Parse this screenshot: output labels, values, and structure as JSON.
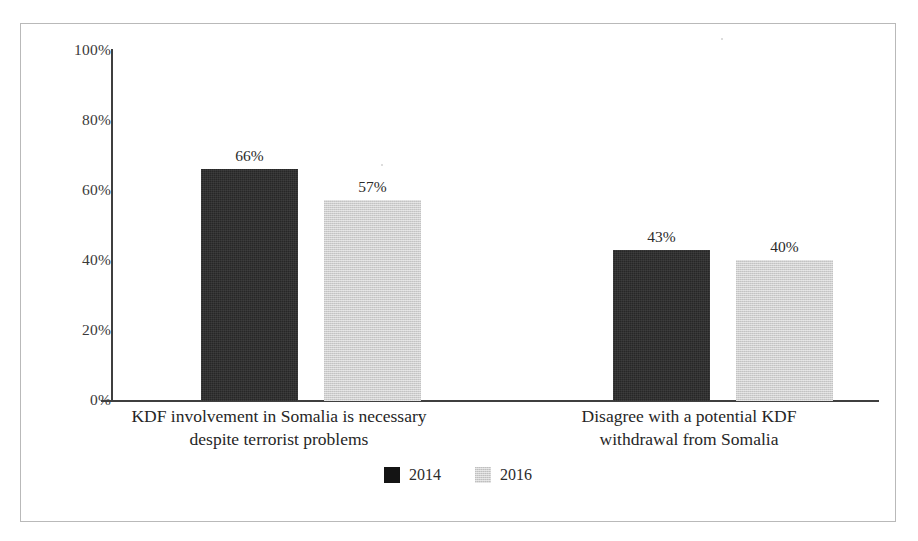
{
  "chart_data": {
    "type": "bar",
    "title": "",
    "xlabel": "",
    "ylabel": "",
    "ylim": [
      0,
      100
    ],
    "grid": false,
    "legend_position": "bottom-center",
    "categories": [
      "KDF involvement in Somalia is necessary despite terrorist problems",
      "Disagree with a potential KDF withdrawal from Somalia"
    ],
    "category_lines": [
      [
        "KDF involvement in Somalia is necessary",
        "despite terrorist problems"
      ],
      [
        "Disagree with a potential KDF",
        "withdrawal from Somalia"
      ]
    ],
    "ytick_labels": [
      "100%",
      "80%",
      "60%",
      "40%",
      "20%",
      "0%"
    ],
    "ytick_values": [
      100,
      80,
      60,
      40,
      20,
      0
    ],
    "series": [
      {
        "name": "2014",
        "color": "#272727",
        "values": [
          66,
          43
        ],
        "value_labels": [
          "66%",
          "43%"
        ]
      },
      {
        "name": "2016",
        "color": "#cfcfcf",
        "values": [
          57,
          40
        ],
        "value_labels": [
          "57%",
          "40%"
        ]
      }
    ]
  },
  "legend": {
    "items": [
      {
        "label": "2014",
        "swatch": "dark"
      },
      {
        "label": "2016",
        "swatch": "light"
      }
    ]
  }
}
